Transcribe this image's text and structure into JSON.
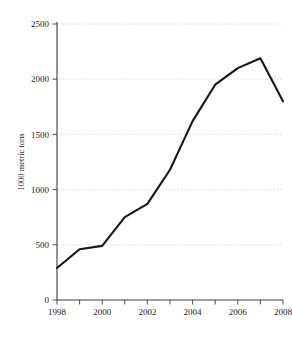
{
  "chart_data": {
    "type": "line",
    "title": "",
    "subtitle": "",
    "xlabel": "",
    "ylabel": "1000 metric tons",
    "x": [
      1998,
      1999,
      2000,
      2001,
      2002,
      2003,
      2004,
      2005,
      2006,
      2007,
      2008
    ],
    "values": [
      290,
      460,
      490,
      750,
      870,
      1180,
      1620,
      1950,
      2100,
      2190,
      1800
    ],
    "series": [
      {
        "name": "",
        "values": [
          290,
          460,
          490,
          750,
          870,
          1180,
          1620,
          1950,
          2100,
          2190,
          1800
        ]
      }
    ],
    "xlim": [
      1998,
      2008
    ],
    "ylim": [
      0,
      2500
    ],
    "y_ticks": [
      0,
      500,
      1000,
      1500,
      2000,
      2500
    ],
    "y_tick_labels": [
      "0",
      "500",
      "1000",
      "1500",
      "2000",
      "2500"
    ],
    "x_ticks": [
      1998,
      1999,
      2000,
      2001,
      2002,
      2003,
      2004,
      2005,
      2006,
      2007,
      2008
    ],
    "x_tick_labels_major": [
      "1998",
      "2000",
      "2002",
      "2004",
      "2006",
      "2008"
    ],
    "x_major_ticks": [
      1998,
      2000,
      2002,
      2004,
      2006,
      2008
    ],
    "grid": true,
    "grid_axis": "y",
    "legend": false,
    "legend_position": "none",
    "line_color": "#151515",
    "grid_color": "#b9b9b9",
    "axis_color": "#3b3b3b",
    "background_color": "#ffffff",
    "annotations": []
  },
  "axis": {
    "y_title": "1000 metric tons",
    "y_labels": {
      "t0": "0",
      "t1": "500",
      "t2": "1000",
      "t3": "1500",
      "t4": "2000",
      "t5": "2500"
    },
    "x_labels": {
      "t1998": "1998",
      "t2000": "2000",
      "t2002": "2002",
      "t2004": "2004",
      "t2006": "2006",
      "t2008": "2008"
    }
  }
}
